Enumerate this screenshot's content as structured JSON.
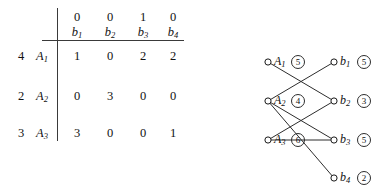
{
  "matrix": {
    "column_weights": [
      "0",
      "0",
      "1",
      "0"
    ],
    "column_labels": [
      {
        "base": "b",
        "sub": "1"
      },
      {
        "base": "b",
        "sub": "2"
      },
      {
        "base": "b",
        "sub": "3"
      },
      {
        "base": "b",
        "sub": "4"
      }
    ],
    "rows": [
      {
        "weight": "4",
        "label_base": "A",
        "label_sub": "1",
        "values": [
          "1",
          "0",
          "2",
          "2"
        ]
      },
      {
        "weight": "2",
        "label_base": "A",
        "label_sub": "2",
        "values": [
          "0",
          "3",
          "0",
          "0"
        ]
      },
      {
        "weight": "3",
        "label_base": "A",
        "label_sub": "3",
        "values": [
          "3",
          "0",
          "0",
          "1"
        ]
      }
    ]
  },
  "graph": {
    "left_nodes": [
      {
        "id": "A1",
        "base": "A",
        "sub": "1",
        "badge": "5",
        "cx": 78,
        "cy": 62
      },
      {
        "id": "A2",
        "base": "A",
        "sub": "2",
        "badge": "4",
        "cx": 78,
        "cy": 101
      },
      {
        "id": "A3",
        "base": "A",
        "sub": "3",
        "badge": "6",
        "cx": 78,
        "cy": 140
      }
    ],
    "right_nodes": [
      {
        "id": "b1",
        "base": "b",
        "sub": "1",
        "badge": "5",
        "cx": 144,
        "cy": 62
      },
      {
        "id": "b2",
        "base": "b",
        "sub": "2",
        "badge": "3",
        "cx": 144,
        "cy": 101
      },
      {
        "id": "b3",
        "base": "b",
        "sub": "3",
        "badge": "5",
        "cx": 144,
        "cy": 140
      },
      {
        "id": "b4",
        "base": "b",
        "sub": "4",
        "badge": "2",
        "cx": 144,
        "cy": 178
      }
    ],
    "edges": [
      {
        "from": "A1",
        "to": "b2"
      },
      {
        "from": "A2",
        "to": "b1"
      },
      {
        "from": "A2",
        "to": "b3"
      },
      {
        "from": "A2",
        "to": "b4"
      },
      {
        "from": "A3",
        "to": "b2"
      },
      {
        "from": "A3",
        "to": "b3"
      }
    ],
    "colors": {
      "edge": "#2d2d2d",
      "left_node_fill": "#111111",
      "right_node_fill": "#ffffff",
      "node_stroke": "#1a1a1a"
    }
  }
}
